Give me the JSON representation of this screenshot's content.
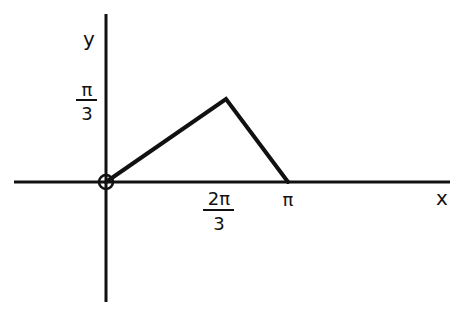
{
  "diagram": {
    "type": "piecewise-linear function graph",
    "axes": {
      "x_label": "x",
      "y_label": "y",
      "color": "#111111"
    },
    "ticks": {
      "x": [
        {
          "numerator": "2π",
          "denominator": "3",
          "value": 2.0944
        },
        {
          "label": "π",
          "value": 3.1416
        }
      ],
      "y": [
        {
          "numerator": "π",
          "denominator": "3",
          "value": 1.0472
        }
      ]
    },
    "origin_marker": "open-circle",
    "polyline": {
      "points": [
        {
          "x": "0",
          "y": "0"
        },
        {
          "x": "2π/3",
          "y": "π/3"
        },
        {
          "x": "π",
          "y": "0"
        }
      ],
      "color": "#111111"
    }
  }
}
